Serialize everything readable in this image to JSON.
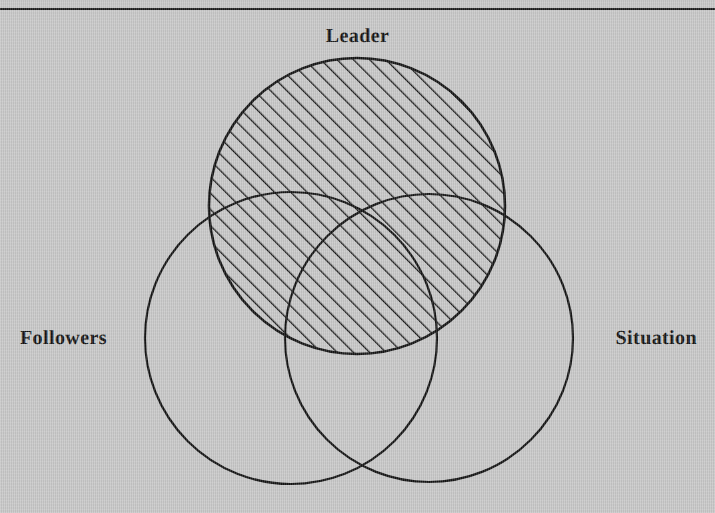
{
  "figure": {
    "kind": "venn-diagram",
    "background_color": "#c8c8c8",
    "ink_color": "#131313",
    "top_rule": {
      "name": "top-horizontal-rule",
      "y": 9,
      "color": "#1a1a1a",
      "thickness": 2
    }
  },
  "labels": {
    "leader": "Leader",
    "followers": "Followers",
    "situation": "Situation"
  },
  "chart_data": {
    "type": "venn",
    "title": "",
    "sets": [
      {
        "name": "Leader",
        "label": "Leader",
        "cx": 357,
        "cy": 206,
        "r": 148,
        "fill": "hatched",
        "hatch_angle_deg": 45,
        "hatch_spacing_px": 11.5,
        "stroke": "#131313",
        "stroke_width": 2.6,
        "label_position": "top"
      },
      {
        "name": "Followers",
        "label": "Followers",
        "cx": 291,
        "cy": 338,
        "r": 146,
        "fill": "none",
        "stroke": "#131313",
        "stroke_width": 2.2,
        "label_position": "left"
      },
      {
        "name": "Situation",
        "label": "Situation",
        "cx": 429,
        "cy": 338,
        "r": 144,
        "fill": "none",
        "stroke": "#131313",
        "stroke_width": 2.2,
        "label_position": "right"
      }
    ],
    "highlighted_set": "Leader",
    "legend": [],
    "annotations": []
  }
}
